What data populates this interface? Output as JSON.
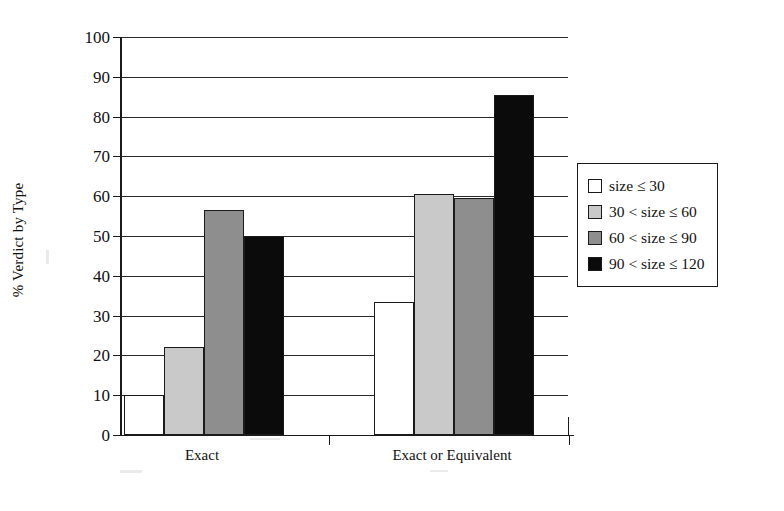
{
  "chart_data": {
    "type": "bar",
    "title": "",
    "xlabel": "",
    "ylabel": "% Verdict by Type",
    "ylim": [
      0,
      100
    ],
    "ytick_step": 10,
    "yticks": [
      "100",
      "90",
      "80",
      "70",
      "60",
      "50",
      "40",
      "30",
      "20",
      "10",
      "0"
    ],
    "grid": true,
    "legend_position": "right",
    "categories": [
      "Exact",
      "Exact or Equivalent"
    ],
    "series": [
      {
        "name": "size ≤ 30",
        "color": "#ffffff",
        "values": [
          10,
          33.5
        ]
      },
      {
        "name": "30 < size ≤ 60",
        "color": "#c9c9c9",
        "values": [
          22,
          60.5
        ]
      },
      {
        "name": "60 < size ≤ 90",
        "color": "#8e8e8e",
        "values": [
          56.5,
          59.5
        ]
      },
      {
        "name": "90 < size ≤ 120",
        "color": "#0b0b0b",
        "values": [
          50,
          85.5
        ]
      }
    ]
  },
  "legend": {
    "entries": [
      {
        "label": "size ≤ 30"
      },
      {
        "label": "30 < size ≤ 60"
      },
      {
        "label": "60 < size ≤ 90"
      },
      {
        "label": "90 < size ≤ 120"
      }
    ]
  }
}
